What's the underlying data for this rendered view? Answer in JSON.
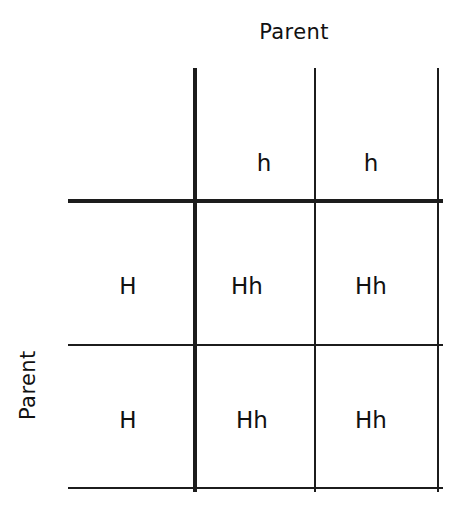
{
  "figure": {
    "kind": "punnett-square",
    "top_axis_title": "Parent",
    "left_axis_title": "Parent",
    "background_color": "#ffffff",
    "line_color": "#1c1c1c",
    "text_color": "#111111"
  },
  "chart_data": {
    "type": "table",
    "xlabel": "Parent",
    "ylabel": "Parent",
    "column_gametes": [
      "h",
      "h"
    ],
    "row_gametes": [
      "H",
      "H"
    ],
    "cells": [
      [
        "Hh",
        "Hh"
      ],
      [
        "Hh",
        "Hh"
      ]
    ],
    "grid": true,
    "legend": "none"
  },
  "grid": {
    "column_headers": [
      {
        "label": "h",
        "x": 264,
        "y": 163
      },
      {
        "label": "h",
        "x": 371,
        "y": 163
      }
    ],
    "row_headers": [
      {
        "label": "H",
        "x": 128,
        "y": 286
      },
      {
        "label": "H",
        "x": 128,
        "y": 420
      }
    ],
    "body_cells": [
      {
        "label": "Hh",
        "x": 247,
        "y": 286
      },
      {
        "label": "Hh",
        "x": 371,
        "y": 286
      },
      {
        "label": "Hh",
        "x": 252,
        "y": 420
      },
      {
        "label": "Hh",
        "x": 371,
        "y": 420
      }
    ],
    "vertical_lines": [
      {
        "x": 193,
        "y": 68,
        "height": 424,
        "width": 4
      },
      {
        "x": 314,
        "y": 68,
        "height": 424,
        "width": 2
      },
      {
        "x": 437,
        "y": 68,
        "height": 424,
        "width": 2
      }
    ],
    "horizontal_lines": [
      {
        "x": 68,
        "y": 199,
        "width": 375,
        "height": 4
      },
      {
        "x": 68,
        "y": 344,
        "width": 375,
        "height": 2
      },
      {
        "x": 68,
        "y": 487,
        "width": 375,
        "height": 2
      }
    ]
  }
}
